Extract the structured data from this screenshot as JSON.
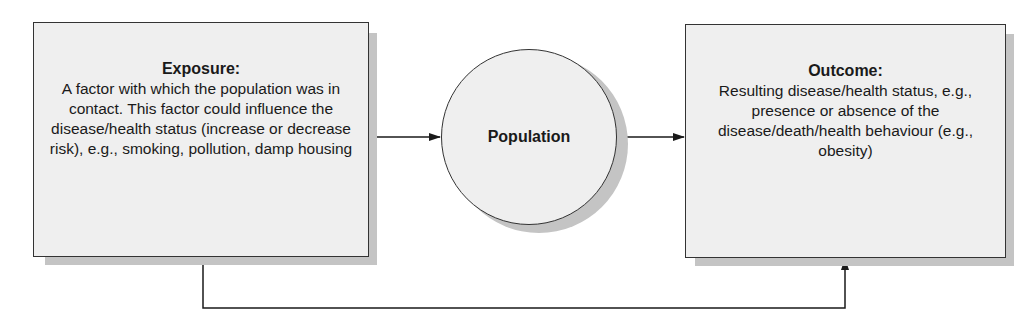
{
  "diagram": {
    "exposure": {
      "title": "Exposure:",
      "body": "A factor with which the population was in contact. This factor could influence the disease/health status (increase or decrease risk), e.g., smoking, pollution, damp housing"
    },
    "population": {
      "label": "Population"
    },
    "outcome": {
      "title": "Outcome:",
      "body": "Resulting disease/health status, e.g., presence or absence of the disease/death/health behaviour (e.g., obesity)"
    },
    "connections": [
      {
        "from": "exposure",
        "to": "population"
      },
      {
        "from": "population",
        "to": "outcome"
      },
      {
        "from": "exposure",
        "to": "outcome"
      }
    ],
    "colors": {
      "box_fill": "#efefef",
      "shadow": "#c4c4c4",
      "stroke": "#333333"
    }
  }
}
